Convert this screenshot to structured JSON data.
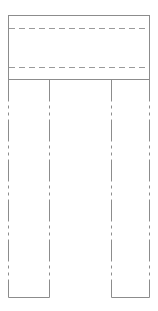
{
  "diagram": {
    "type": "technical-outline",
    "colors": {
      "outline": "#8c8c8c",
      "dashed": "#9a9a9a",
      "background": "#ffffff"
    },
    "top_box": {
      "x": 8,
      "y": 15,
      "width": 141,
      "height": 64
    },
    "dashed_lines": [
      {
        "y": 28,
        "x1": 8,
        "x2": 149
      },
      {
        "y": 67,
        "x1": 8,
        "x2": 149
      }
    ],
    "legs": [
      {
        "name": "left",
        "x1": 8,
        "x2": 49,
        "y_top": 79,
        "y_bottom": 297
      },
      {
        "name": "right",
        "x1": 111,
        "x2": 149,
        "y_top": 79,
        "y_bottom": 297
      }
    ]
  }
}
